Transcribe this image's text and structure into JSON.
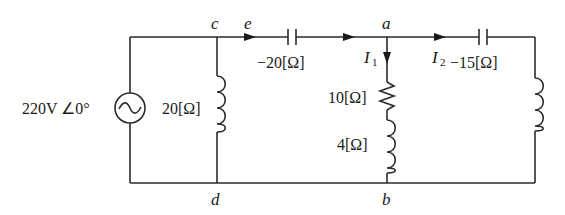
{
  "diagram": {
    "type": "ac-circuit",
    "source": {
      "label": "220V ∠0°",
      "symbol": "ac-voltage-source"
    },
    "nodes": {
      "a": "a",
      "b": "b",
      "c": "c",
      "d": "d",
      "e": "e"
    },
    "currents": {
      "I1": {
        "main": "I",
        "sub": "1",
        "direction": "down"
      },
      "I2": {
        "main": "I",
        "sub": "2",
        "direction": "right"
      }
    },
    "components": {
      "shunt_inductor": {
        "label": "20[Ω]",
        "type": "inductor"
      },
      "series_capacitor": {
        "label": "−20[Ω]",
        "type": "capacitor"
      },
      "branch_resistor": {
        "label": "10[Ω]",
        "type": "resistor"
      },
      "branch_inductor": {
        "label": "4[Ω]",
        "type": "inductor"
      },
      "right_capacitor": {
        "label": "−15[Ω]",
        "type": "capacitor"
      },
      "right_inductor": {
        "label": "",
        "type": "inductor"
      }
    },
    "colors": {
      "line": "#2b2b2b",
      "text": "#1a1a1a",
      "background": "#ffffff"
    }
  }
}
